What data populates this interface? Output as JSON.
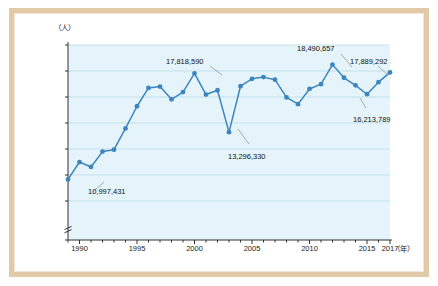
{
  "figure": {
    "frame_color": "#e2c9a8",
    "background": "#ffffff"
  },
  "chart_data": {
    "type": "line",
    "title": "",
    "subtitle": "",
    "xlabel": "（年）",
    "ylabel": "（人）",
    "grid": true,
    "legend": "none",
    "axis_break": true,
    "line_color": "#3d85be",
    "marker_color": "#3d85be",
    "plot_background": "#e4f4fa",
    "xlim": [
      1989,
      2017
    ],
    "ylim": [
      7000000,
      20000000
    ],
    "yticks": [
      0,
      8000000,
      10000000,
      12000000,
      14000000,
      16000000,
      18000000,
      20000000
    ],
    "ytick_labels": [
      "0",
      "8,000,000",
      "10,000,000",
      "12,000,000",
      "14,000,000",
      "16,000,000",
      "18,000,000",
      "20,000,000"
    ],
    "xticks": [
      1990,
      1995,
      2000,
      2005,
      2010,
      2015,
      2017
    ],
    "xtick_labels": [
      "1990",
      "1995",
      "2000",
      "2005",
      "2010",
      "2015",
      "2017"
    ],
    "x": [
      1989,
      1990,
      1991,
      1992,
      1993,
      1994,
      1995,
      1996,
      1997,
      1998,
      1999,
      2000,
      2001,
      2002,
      2003,
      2004,
      2005,
      2006,
      2007,
      2008,
      2009,
      2010,
      2011,
      2012,
      2013,
      2014,
      2015,
      2016,
      2017
    ],
    "values": [
      9660000,
      10997431,
      10620000,
      11800000,
      11950000,
      13580000,
      15290000,
      16700000,
      16800000,
      15820000,
      16380000,
      17818590,
      16190000,
      16520000,
      13296330,
      16830000,
      17400000,
      17530000,
      17330000,
      15970000,
      15450000,
      16620000,
      16990000,
      18490657,
      17480000,
      16900000,
      16213789,
      17140000,
      17889292
    ],
    "annotations": [
      {
        "year": 1990,
        "label": "10,997,431",
        "value": 10997431
      },
      {
        "year": 2000,
        "label": "17,818,590",
        "value": 17818590
      },
      {
        "year": 2003,
        "label": "13,296,330",
        "value": 13296330
      },
      {
        "year": 2012,
        "label": "18,490,657",
        "value": 18490657
      },
      {
        "year": 2014,
        "label": "16,213,789",
        "value": 16213789
      },
      {
        "year": 2017,
        "label": "17,889,292",
        "value": 17889292
      }
    ]
  }
}
